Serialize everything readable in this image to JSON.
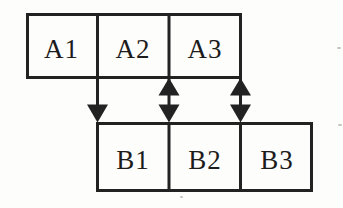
{
  "canvas": {
    "background": "#fdfdfb",
    "line_color": "#222222",
    "text_color": "#1c1c1c"
  },
  "boxes": {
    "row_a": [
      "A1",
      "A2",
      "A3"
    ],
    "row_b": [
      "B1",
      "B2",
      "B3"
    ]
  },
  "connectors": [
    {
      "type": "single-arrow-down",
      "from": "A1/A2 border",
      "to": "B1 top-left corner"
    },
    {
      "type": "double-headed-arrow",
      "from": "A2/A3 border",
      "to": "B1/B2 border"
    },
    {
      "type": "double-headed-arrow",
      "from": "A3 right edge",
      "to": "B2/B3 border"
    }
  ]
}
